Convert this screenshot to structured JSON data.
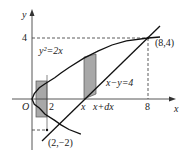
{
  "diagram": {
    "axes": {
      "x_label": "x",
      "y_label": "y",
      "origin_label": "O"
    },
    "tick_labels": {
      "y_4": "4",
      "x_2": "2",
      "x_x": "x",
      "x_xdx": "x+dx",
      "x_8": "8"
    },
    "curves": {
      "parabola_label": "y²=2x",
      "line_label": "x−y=4"
    },
    "points": {
      "upper_intersection": "(8,4)",
      "lower_intersection": "(2,−2)"
    },
    "colors": {
      "strip_fill": "#a8a8a8",
      "stroke": "#111111"
    }
  }
}
